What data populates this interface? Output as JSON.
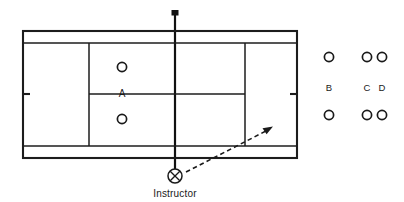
{
  "diagram": {
    "court": {
      "outer": {
        "x": 23,
        "y": 31,
        "width": 274,
        "height": 127
      },
      "singles_top_y": 43,
      "singles_bottom_y": 146,
      "service_line_left_x": 89,
      "service_line_right_x": 245,
      "center_service_line_y": 94,
      "center_marks": [
        {
          "side": "left",
          "x": 23,
          "y": 94,
          "length": 7
        },
        {
          "side": "right",
          "x": 297,
          "y": 94,
          "length": 7
        }
      ],
      "net": {
        "x": 175,
        "y_top": 10,
        "y_bottom": 176
      }
    },
    "on_court_players": [
      {
        "label": "",
        "icon": "circle-marker",
        "x": 122,
        "y": 67
      },
      {
        "label": "A",
        "icon": "text-label",
        "x": 122,
        "y": 94
      },
      {
        "label": "",
        "icon": "circle-marker",
        "x": 122,
        "y": 119
      }
    ],
    "waiting_groups": [
      {
        "name": "group-b",
        "x": 329,
        "label": "B",
        "label_y": 88,
        "markers": [
          {
            "icon": "circle-marker",
            "x": 329,
            "y": 57
          },
          {
            "icon": "circle-marker",
            "x": 329,
            "y": 115
          }
        ]
      },
      {
        "name": "group-cd",
        "labels": [
          {
            "text": "C",
            "x": 367,
            "y": 88
          },
          {
            "text": "D",
            "x": 382,
            "y": 88
          }
        ],
        "markers": [
          {
            "icon": "circle-marker",
            "x": 367,
            "y": 57
          },
          {
            "icon": "circle-marker",
            "x": 382,
            "y": 57
          },
          {
            "icon": "circle-marker",
            "x": 367,
            "y": 115
          },
          {
            "icon": "circle-marker",
            "x": 382,
            "y": 115
          }
        ]
      }
    ],
    "instructor": {
      "label": "Instructor",
      "marker_icon": "circled-x-icon",
      "x": 175,
      "y": 176,
      "radius": 7,
      "label_x": 175,
      "label_y": 193
    },
    "feed_arrow": {
      "icon": "dashed-arrow-icon",
      "from_x": 186,
      "from_y": 172,
      "to_x": 272,
      "to_y": 127,
      "style": "dashed",
      "head": "solid-triangle"
    },
    "colors": {
      "line": "#1c1c1c",
      "text": "#1a1a1a",
      "background": "#ffffff"
    }
  }
}
